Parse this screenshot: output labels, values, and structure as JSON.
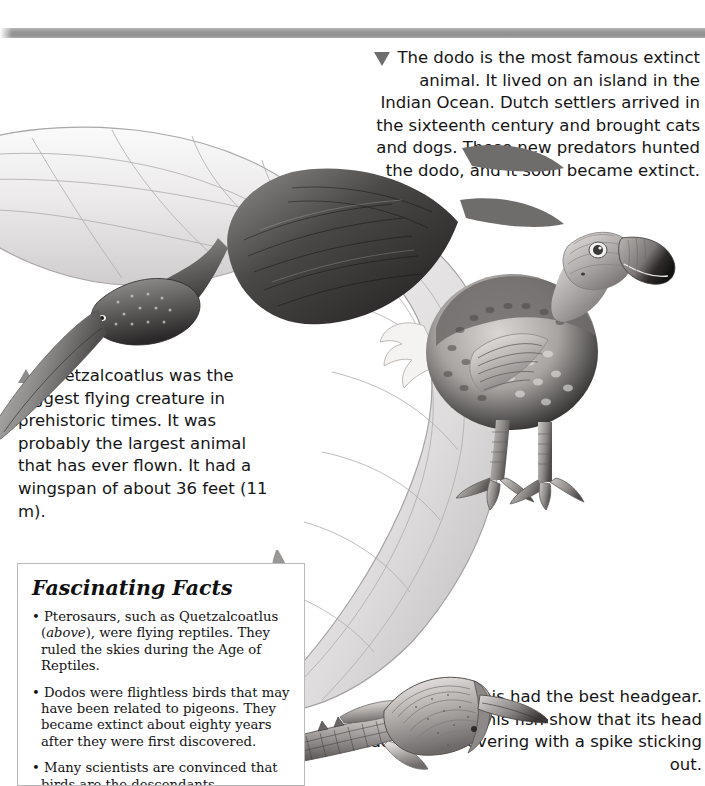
{
  "page": {
    "title": "Extinct Animals",
    "background_color": "#ffffff",
    "rule_color": "#9a9a9a"
  },
  "captions": {
    "dodo": {
      "marker": "triangle-down",
      "text": "The dodo is the most famous extinct animal. It lived on an island in the Indian Ocean. Dutch settlers arrived in the sixteenth century and brought cats and dogs. These new predators hunted the dodo, and it soon became extinct."
    },
    "quetzalcoatlus": {
      "marker": "triangle-up",
      "text": "Quetzalcoatlus was the biggest flying creature in prehistoric times. It was probably the largest animal that has ever flown. It had a wingspan of about 36 feet (11 m)."
    },
    "pteraspis": {
      "marker": "triangle-left",
      "lead": "Pteraspis had the best headgear. ",
      "bold_word": "Fossils",
      "tail": " of this fish show that its head had a bony covering with a spike sticking out."
    }
  },
  "facts_box": {
    "title": "Fascinating Facts",
    "items": [
      {
        "bullet": "•",
        "pre": " Pterosaurs, such as Quetzalcoatlus (",
        "italic": "above",
        "post": "), were flying reptiles. They ruled the skies during the Age of Reptiles."
      },
      {
        "bullet": "•",
        "pre": " Dodos were flightless birds that may have been related to pigeons. They became extinct about eighty years after they were first discovered.",
        "italic": "",
        "post": ""
      },
      {
        "bullet": "•",
        "pre": " Many scientists are convinced that birds are the descendants",
        "italic": "",
        "post": ""
      }
    ]
  },
  "illustrations": {
    "pterosaur": "quetzalcoatlus-illustration",
    "dodo": "dodo-illustration",
    "pteraspis": "pteraspis-fish-illustration"
  }
}
